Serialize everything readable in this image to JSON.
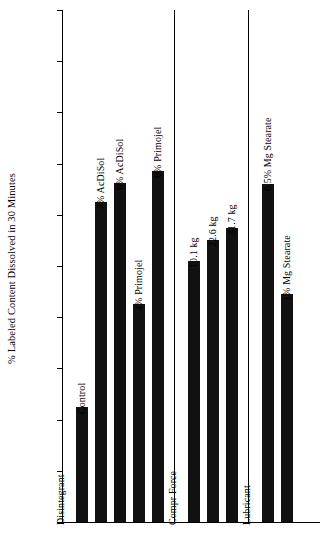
{
  "chart_data": {
    "type": "bar",
    "title": "",
    "xlabel": "",
    "ylabel": "% Labeled Content Dissolved in 30 Minutes",
    "ylim": [
      0,
      100
    ],
    "ytick_labels": [
      "0",
      "10",
      "20",
      "30",
      "40",
      "50",
      "60",
      "70",
      "80",
      "90",
      "100"
    ],
    "ytick_values": [
      0,
      10,
      20,
      30,
      40,
      50,
      60,
      70,
      80,
      90,
      100
    ],
    "grid": false,
    "legend": "none",
    "bar_color": "#111111",
    "categories": [
      "Control",
      "4% AcDiSol",
      "6% AcDiSol",
      "4% Primojel",
      "6% Primojel",
      "10.1 kg",
      "22.6 kg",
      "31.7 kg",
      "0.5% Mg Stearate",
      "1% Mg Stearate"
    ],
    "values": [
      22.5,
      62.5,
      66.2,
      42.5,
      68.5,
      51.0,
      55.0,
      57.5,
      66.0,
      44.5
    ],
    "groups": [
      {
        "name": "Disintegrant",
        "categories": [
          "Control",
          "4% AcDiSol",
          "6% AcDiSol",
          "4% Primojel",
          "6% Primojel"
        ]
      },
      {
        "name": "Compr Force",
        "categories": [
          "10.1 kg",
          "22.6 kg",
          "31.7 kg"
        ]
      },
      {
        "name": "Lubricant",
        "categories": [
          "0.5% Mg Stearate",
          "1% Mg Stearate"
        ]
      }
    ],
    "group_labels": [
      "Disintegrant",
      "Compr Force",
      "Lubricant"
    ]
  }
}
